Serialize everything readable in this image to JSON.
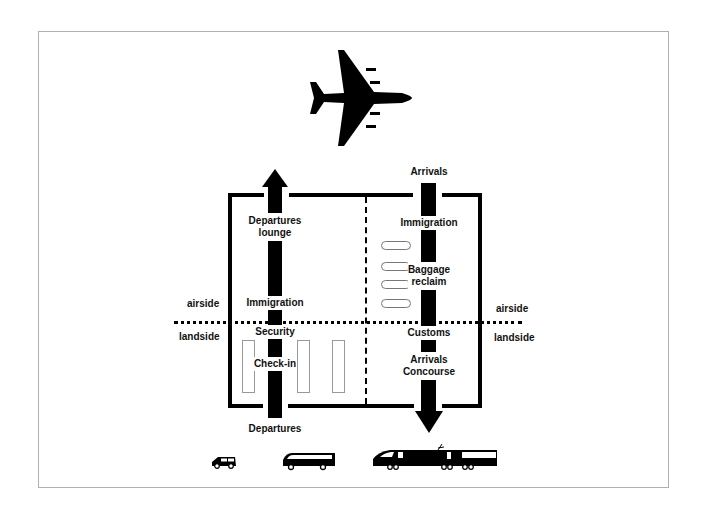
{
  "diagram": {
    "type": "airport-passenger-flow",
    "colors": {
      "ink": "#000000",
      "frame": "#b0b0b0",
      "background": "#ffffff"
    },
    "zones": {
      "upper": "airside",
      "lower": "landside",
      "left_upper_label": "airside",
      "left_lower_label": "landside",
      "right_upper_label": "airside",
      "right_lower_label": "landside"
    },
    "departures_flow": {
      "direction": "up",
      "steps": [
        "Departures",
        "Check-in",
        "Security",
        "Immigration",
        "Departures lounge"
      ],
      "labels": {
        "entry": "Departures",
        "checkin": "Check-in",
        "security": "Security",
        "immigration": "Immigration",
        "lounge_line1": "Departures",
        "lounge_line2": "lounge"
      }
    },
    "arrivals_flow": {
      "direction": "down",
      "steps": [
        "Arrivals",
        "Immigration",
        "Baggage reclaim",
        "Customs",
        "Arrivals Concourse"
      ],
      "labels": {
        "entry": "Arrivals",
        "immigration": "Immigration",
        "baggage_line1": "Baggage",
        "baggage_line2": "reclaim",
        "customs": "Customs",
        "concourse_line1": "Arrivals",
        "concourse_line2": "Concourse"
      }
    },
    "icons": {
      "top": "airplane-icon",
      "ground": [
        "car-icon",
        "coach-icon",
        "train-icon"
      ]
    },
    "checkin_desks": 3,
    "baggage_belts": 4
  }
}
